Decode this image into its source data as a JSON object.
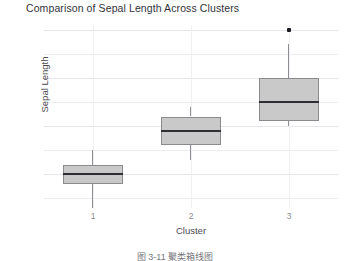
{
  "chart_data": {
    "type": "box",
    "title": "Comparison of Sepal Length Across Clusters",
    "xlabel": "Cluster",
    "ylabel": "Sepal Length",
    "categories": [
      "1",
      "2",
      "3"
    ],
    "ylim": [
      4.3,
      8.1
    ],
    "yticks": [
      5,
      6,
      7,
      8
    ],
    "ytick_labels": [
      "5",
      "6",
      "7",
      "8"
    ],
    "grid": true,
    "grid_minor_step": 0.5,
    "legend": null,
    "boxes": [
      {
        "category": "1",
        "whisker_low": 4.3,
        "q1": 4.8,
        "median": 5.0,
        "q3": 5.2,
        "whisker_high": 5.5,
        "outliers": []
      },
      {
        "category": "2",
        "whisker_low": 5.3,
        "q1": 5.6,
        "median": 5.9,
        "q3": 6.2,
        "whisker_high": 6.4,
        "outliers": []
      },
      {
        "category": "3",
        "whisker_low": 6.0,
        "q1": 6.1,
        "median": 6.5,
        "q3": 7.0,
        "whisker_high": 7.7,
        "outliers": [
          8.0
        ]
      }
    ],
    "colors": {
      "box_fill": "#c9c9c9",
      "box_border": "#8a8a8f",
      "median": "#2e2e33",
      "whisker": "#8e8e93",
      "outlier": "#1a1a1f",
      "grid": "#ececef",
      "text": "#4a4a50",
      "tick_text": "#8c8c92",
      "background": "#ffffff"
    }
  },
  "caption": "图 3-11 聚类箱线图"
}
